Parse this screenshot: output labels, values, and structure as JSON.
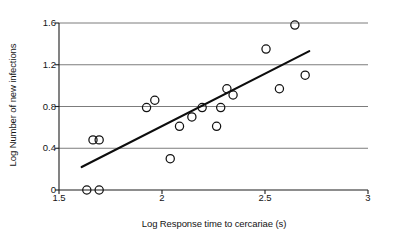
{
  "chart_data": {
    "type": "scatter",
    "title": "",
    "xlabel": "Log Response time to cercariae (s)",
    "ylabel": "Log Number of new infections",
    "xlim": [
      1.5,
      3
    ],
    "ylim": [
      0,
      1.6
    ],
    "xticks": [
      "1.5",
      "2",
      "2.5",
      "3"
    ],
    "xtick_values": [
      1.5,
      2,
      2.5,
      3
    ],
    "yticks": [
      "0",
      "0.4",
      "0.8",
      "1.2",
      "1.6"
    ],
    "ytick_values": [
      0,
      0.4,
      0.8,
      1.2,
      1.6
    ],
    "grid": "horizontal",
    "legend": "none",
    "marker": "open-circle",
    "points": [
      {
        "x": 1.635,
        "y": 0.0
      },
      {
        "x": 1.695,
        "y": 0.0
      },
      {
        "x": 1.665,
        "y": 0.48
      },
      {
        "x": 1.695,
        "y": 0.48
      },
      {
        "x": 1.925,
        "y": 0.79
      },
      {
        "x": 1.965,
        "y": 0.86
      },
      {
        "x": 2.04,
        "y": 0.3
      },
      {
        "x": 2.085,
        "y": 0.61
      },
      {
        "x": 2.145,
        "y": 0.7
      },
      {
        "x": 2.195,
        "y": 0.79
      },
      {
        "x": 2.265,
        "y": 0.61
      },
      {
        "x": 2.285,
        "y": 0.79
      },
      {
        "x": 2.315,
        "y": 0.97
      },
      {
        "x": 2.345,
        "y": 0.91
      },
      {
        "x": 2.505,
        "y": 1.35
      },
      {
        "x": 2.57,
        "y": 0.97
      },
      {
        "x": 2.645,
        "y": 1.58
      },
      {
        "x": 2.695,
        "y": 1.1
      }
    ],
    "fit_line": {
      "type": "linear-regression",
      "x_start": 1.61,
      "y_start": 0.22,
      "x_end": 2.715,
      "y_end": 1.33
    }
  }
}
